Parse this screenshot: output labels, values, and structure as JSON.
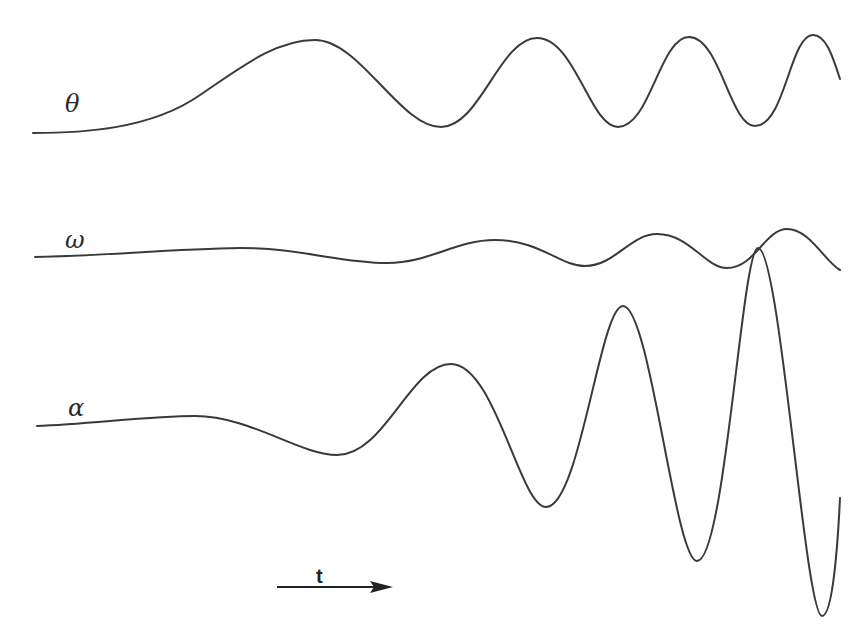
{
  "diagram": {
    "title": "",
    "signals": [
      {
        "id": "theta",
        "label": "θ",
        "label_pos": {
          "x": 65,
          "y": 92
        },
        "baseline_y": 133,
        "description": "Angle signal: slow initial rise then oscillation with increasing frequency and roughly constant amplitude",
        "path": "M33,133 C80,133 150,130 200,95 C240,68 275,40 315,40 C360,40 400,127 441,127 C480,127 500,38 537,38 C575,38 590,127 618,127 C650,127 660,37 689,37 C720,37 730,126 755,126 C785,126 790,35 813,35 C828,35 835,65 840,79"
      },
      {
        "id": "omega",
        "label": "ω",
        "label_pos": {
          "x": 65,
          "y": 228
        },
        "baseline_y": 257,
        "description": "Angular velocity signal: small-amplitude oscillation growing slowly",
        "path": "M35,257 C100,256 170,249 240,248 C300,248 340,263 387,263 C430,263 455,240 495,240 C540,240 560,266 585,266 C615,266 630,234 657,234 C690,234 705,268 727,268 C755,268 765,229 787,229 C810,229 825,262 840,270"
      },
      {
        "id": "alpha",
        "label": "α",
        "label_pos": {
          "x": 68,
          "y": 396
        },
        "baseline_y": 426,
        "description": "Angular acceleration signal: oscillation with rapidly growing amplitude and frequency",
        "path": "M37,426 C90,424 150,416 195,416 C250,416 300,455 337,455 C385,455 410,364 451,364 C495,364 520,507 546,507 C580,507 600,306 623,306 C650,306 675,561 697,561 C725,561 742,248 758,248 C780,248 805,616 822,616 C833,616 838,540 840,498"
      }
    ],
    "time_axis": {
      "label": "t",
      "arrow_start": {
        "x": 277,
        "y": 587
      },
      "arrow_end": {
        "x": 393,
        "y": 587
      },
      "label_pos": {
        "x": 316,
        "y": 566
      }
    },
    "colors": {
      "stroke": "#3a3a3a",
      "background": "#ffffff",
      "text": "#2a2a2a"
    }
  }
}
